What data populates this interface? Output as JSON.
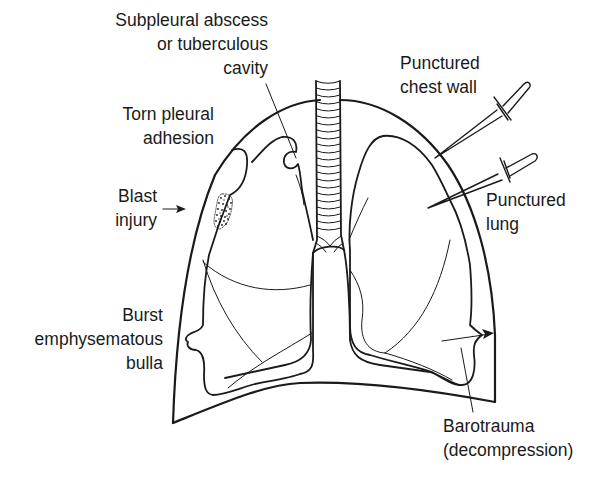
{
  "diagram": {
    "labels": [
      {
        "id": "subpleural-abscess",
        "lines": [
          "Subpleural abscess",
          "or tuberculous",
          "cavity"
        ]
      },
      {
        "id": "torn-pleural-adhesion",
        "lines": [
          "Torn pleural",
          "adhesion"
        ]
      },
      {
        "id": "blast-injury",
        "lines": [
          "Blast",
          "injury"
        ]
      },
      {
        "id": "burst-bulla",
        "lines": [
          "Burst",
          "emphysematous",
          "bulla"
        ]
      },
      {
        "id": "punctured-chest-wall",
        "lines": [
          "Punctured",
          "chest wall"
        ]
      },
      {
        "id": "punctured-lung",
        "lines": [
          "Punctured",
          "lung"
        ]
      },
      {
        "id": "barotrauma",
        "lines": [
          "Barotrauma",
          "(decompression)"
        ]
      }
    ],
    "colors": {
      "line": "#1a1a1a",
      "background": "#ffffff"
    }
  }
}
